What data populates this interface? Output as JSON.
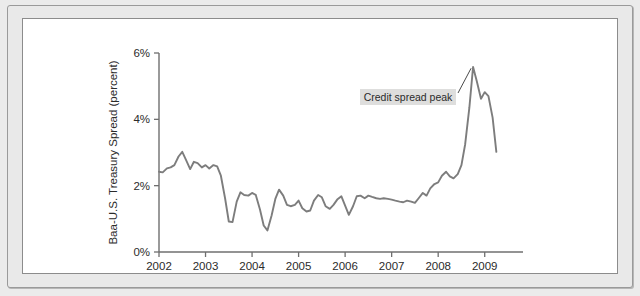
{
  "figure": {
    "background_color": "#ebebeb",
    "panel_color": "#ffffff",
    "frame_color": "#9a9a9a"
  },
  "chart_data": {
    "type": "line",
    "title": "",
    "xlabel": "",
    "ylabel": "Baa-U.S. Treasury Spread (percent)",
    "xlim": [
      2002.0,
      2009.35
    ],
    "ylim": [
      0,
      6
    ],
    "grid": false,
    "legend": null,
    "line_color": "#7d7d7d",
    "xtick_labels": [
      "2002",
      "2003",
      "2004",
      "2005",
      "2006",
      "2007",
      "2008",
      "2009"
    ],
    "xtick_values": [
      2002,
      2003,
      2004,
      2005,
      2006,
      2007,
      2008,
      2009
    ],
    "ytick_labels": [
      "0%",
      "2%",
      "4%",
      "6%"
    ],
    "ytick_values": [
      0,
      2,
      4,
      6
    ],
    "annotations": [
      {
        "text": "Credit spread peak",
        "target_x": 2008.75,
        "target_y": 5.6,
        "box_color": "#dededd"
      }
    ],
    "series": [
      {
        "name": "Baa-U.S. Treasury Spread",
        "x": [
          2002.0,
          2002.08,
          2002.17,
          2002.25,
          2002.33,
          2002.42,
          2002.5,
          2002.58,
          2002.67,
          2002.75,
          2002.83,
          2002.92,
          2003.0,
          2003.08,
          2003.17,
          2003.25,
          2003.33,
          2003.42,
          2003.5,
          2003.58,
          2003.67,
          2003.75,
          2003.83,
          2003.92,
          2004.0,
          2004.08,
          2004.17,
          2004.25,
          2004.33,
          2004.42,
          2004.5,
          2004.58,
          2004.67,
          2004.75,
          2004.83,
          2004.92,
          2005.0,
          2005.08,
          2005.17,
          2005.25,
          2005.33,
          2005.42,
          2005.5,
          2005.58,
          2005.67,
          2005.75,
          2005.83,
          2005.92,
          2006.0,
          2006.08,
          2006.17,
          2006.25,
          2006.33,
          2006.42,
          2006.5,
          2006.58,
          2006.67,
          2006.75,
          2006.83,
          2006.92,
          2007.0,
          2007.08,
          2007.17,
          2007.25,
          2007.33,
          2007.42,
          2007.5,
          2007.58,
          2007.67,
          2007.75,
          2007.83,
          2007.92,
          2008.0,
          2008.08,
          2008.17,
          2008.25,
          2008.33,
          2008.42,
          2008.5,
          2008.58,
          2008.67,
          2008.75,
          2008.83,
          2008.92,
          2009.0,
          2009.08,
          2009.17,
          2009.25
        ],
        "values": [
          2.42,
          2.4,
          2.52,
          2.55,
          2.62,
          2.88,
          3.02,
          2.78,
          2.5,
          2.72,
          2.68,
          2.55,
          2.62,
          2.52,
          2.62,
          2.58,
          2.3,
          1.62,
          0.92,
          0.9,
          1.52,
          1.8,
          1.72,
          1.7,
          1.78,
          1.72,
          1.28,
          0.8,
          0.65,
          1.1,
          1.6,
          1.88,
          1.7,
          1.42,
          1.38,
          1.42,
          1.55,
          1.32,
          1.22,
          1.25,
          1.55,
          1.72,
          1.65,
          1.38,
          1.3,
          1.42,
          1.58,
          1.68,
          1.4,
          1.12,
          1.38,
          1.68,
          1.7,
          1.62,
          1.7,
          1.66,
          1.62,
          1.6,
          1.62,
          1.6,
          1.58,
          1.55,
          1.52,
          1.5,
          1.55,
          1.52,
          1.48,
          1.62,
          1.78,
          1.7,
          1.92,
          2.05,
          2.1,
          2.3,
          2.42,
          2.28,
          2.22,
          2.35,
          2.62,
          3.25,
          4.35,
          5.58,
          5.15,
          4.62,
          4.82,
          4.7,
          4.05,
          3.02
        ]
      }
    ]
  }
}
